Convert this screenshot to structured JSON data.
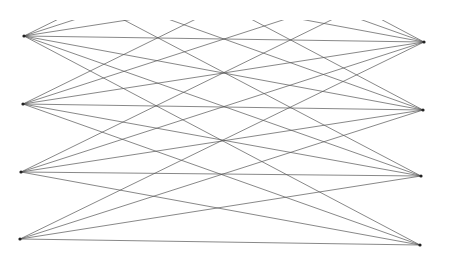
{
  "figure": {
    "type": "string-art line diagram",
    "width": 450,
    "height": 259,
    "background": "#ffffff",
    "line_color": "#555555",
    "node_color": "#222222",
    "clip_top": 20,
    "clip_bottom": 250,
    "row_spacing": 68,
    "left_nodes": [
      {
        "x": 24,
        "y": 36
      },
      {
        "x": 23,
        "y": 104
      },
      {
        "x": 21,
        "y": 172
      },
      {
        "x": 20,
        "y": 239
      }
    ],
    "right_nodes": [
      {
        "x": 424,
        "y": 42
      },
      {
        "x": 423,
        "y": 110
      },
      {
        "x": 421,
        "y": 176
      },
      {
        "x": 420,
        "y": 245
      }
    ],
    "row_offsets": [
      -3,
      -2,
      -1,
      0,
      1,
      2,
      3
    ]
  }
}
